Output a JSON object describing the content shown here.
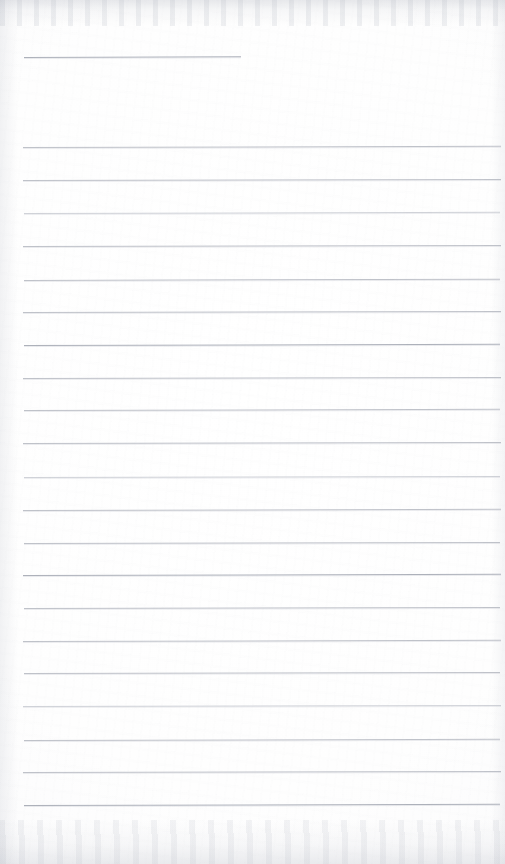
{
  "document": {
    "kind": "scanned-lined-notepad-page",
    "title": "Lined Notepad Page",
    "page_width": 505,
    "page_height": 864,
    "is_blank": true,
    "handwriting_present": false,
    "typed_text_present": false,
    "visible_text": "",
    "colors": {
      "paper": "#ffffff",
      "paper_shadow": "#f7f7f8",
      "rule_ink": "#b9bcc4",
      "rule_ink_faint": "#c6c9d0",
      "rule_ink_strong": "#a9adb7",
      "scan_edge_smudge": "#b0b4be"
    },
    "ruling": {
      "line_count": 22,
      "left_margin_x": 24,
      "right_end_x": 500,
      "nominal_spacing_px": 32.5,
      "thickness_px": 1,
      "has_vertical_margin_rule": false,
      "first_line_is_short": true,
      "first_line_right_end_x": 241,
      "gap_after_first_line_px": 90
    },
    "lines": [
      {
        "index": 1,
        "y": 57,
        "x1": 24,
        "x2": 241,
        "weight": "strong",
        "tilt_deg": -0.18,
        "note": "short header rule"
      },
      {
        "index": 2,
        "y": 147,
        "x1": 23,
        "x2": 501,
        "weight": "normal",
        "tilt_deg": -0.14
      },
      {
        "index": 3,
        "y": 180,
        "x1": 23,
        "x2": 501,
        "weight": "normal",
        "tilt_deg": -0.12
      },
      {
        "index": 4,
        "y": 213,
        "x1": 24,
        "x2": 500,
        "weight": "faint",
        "tilt_deg": -0.15
      },
      {
        "index": 5,
        "y": 246,
        "x1": 23,
        "x2": 501,
        "weight": "normal",
        "tilt_deg": -0.12
      },
      {
        "index": 6,
        "y": 280,
        "x1": 24,
        "x2": 500,
        "weight": "normal",
        "tilt_deg": -0.16
      },
      {
        "index": 7,
        "y": 312,
        "x1": 23,
        "x2": 501,
        "weight": "normal",
        "tilt_deg": -0.13
      },
      {
        "index": 8,
        "y": 345,
        "x1": 24,
        "x2": 500,
        "weight": "strong",
        "tilt_deg": -0.14
      },
      {
        "index": 9,
        "y": 378,
        "x1": 23,
        "x2": 501,
        "weight": "normal",
        "tilt_deg": -0.12
      },
      {
        "index": 10,
        "y": 410,
        "x1": 24,
        "x2": 500,
        "weight": "normal",
        "tilt_deg": -0.15
      },
      {
        "index": 11,
        "y": 443,
        "x1": 23,
        "x2": 501,
        "weight": "normal",
        "tilt_deg": -0.13
      },
      {
        "index": 12,
        "y": 477,
        "x1": 24,
        "x2": 500,
        "weight": "faint",
        "tilt_deg": -0.12
      },
      {
        "index": 13,
        "y": 510,
        "x1": 23,
        "x2": 501,
        "weight": "normal",
        "tilt_deg": -0.14
      },
      {
        "index": 14,
        "y": 543,
        "x1": 24,
        "x2": 500,
        "weight": "normal",
        "tilt_deg": -0.13
      },
      {
        "index": 15,
        "y": 575,
        "x1": 23,
        "x2": 501,
        "weight": "strong",
        "tilt_deg": -0.15
      },
      {
        "index": 16,
        "y": 608,
        "x1": 24,
        "x2": 500,
        "weight": "normal",
        "tilt_deg": -0.12
      },
      {
        "index": 17,
        "y": 641,
        "x1": 23,
        "x2": 501,
        "weight": "normal",
        "tilt_deg": -0.14
      },
      {
        "index": 18,
        "y": 673,
        "x1": 24,
        "x2": 500,
        "weight": "normal",
        "tilt_deg": -0.13
      },
      {
        "index": 19,
        "y": 706,
        "x1": 23,
        "x2": 501,
        "weight": "faint",
        "tilt_deg": -0.12
      },
      {
        "index": 20,
        "y": 740,
        "x1": 24,
        "x2": 500,
        "weight": "normal",
        "tilt_deg": -0.15
      },
      {
        "index": 21,
        "y": 772,
        "x1": 23,
        "x2": 501,
        "weight": "normal",
        "tilt_deg": -0.13
      },
      {
        "index": 22,
        "y": 805,
        "x1": 24,
        "x2": 500,
        "weight": "strong",
        "tilt_deg": -0.14,
        "note": "last rule; blank area below"
      }
    ],
    "blank_region_below_last_line": {
      "y_from": 806,
      "y_to": 864
    }
  }
}
